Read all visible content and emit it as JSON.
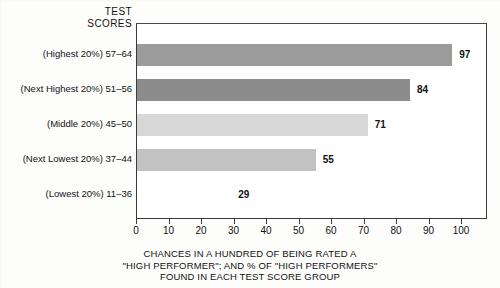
{
  "header": {
    "line1": "TEST",
    "line2": "SCORES"
  },
  "caption": {
    "line1": "CHANCES IN A HUNDRED OF BEING RATED A",
    "line2": "\"HIGH PERFORMER\"; AND % OF \"HIGH PERFORMERS\"",
    "line3": "FOUND IN EACH TEST SCORE GROUP"
  },
  "axis": {
    "ticks": [
      "0",
      "10",
      "20",
      "30",
      "40",
      "50",
      "60",
      "70",
      "80",
      "90",
      "100"
    ]
  },
  "chart_data": {
    "type": "bar",
    "orientation": "horizontal",
    "title": "TEST SCORES",
    "xlabel": "CHANCES IN A HUNDRED OF BEING RATED A \"HIGH PERFORMER\"; AND % OF \"HIGH PERFORMERS\" FOUND IN EACH TEST SCORE GROUP",
    "ylabel": "",
    "xlim": [
      0,
      108
    ],
    "xticks": [
      0,
      10,
      20,
      30,
      40,
      50,
      60,
      70,
      80,
      90,
      100
    ],
    "grid": false,
    "legend": "none",
    "categories": [
      "(Highest 20%) 57–64",
      "(Next Highest 20%) 51–56",
      "(Middle  20%) 45–50",
      "(Next Lowest  20%) 37–44",
      "(Lowest  20%) 11–36"
    ],
    "values": [
      97,
      84,
      71,
      55,
      29
    ],
    "value_labels": [
      "97",
      "84",
      "71",
      "55",
      "29"
    ],
    "bar_colors": [
      "#9b9b9b",
      "#8c8c8c",
      "#d7d7d7",
      "#c2c2c2",
      "#ffffff"
    ]
  }
}
